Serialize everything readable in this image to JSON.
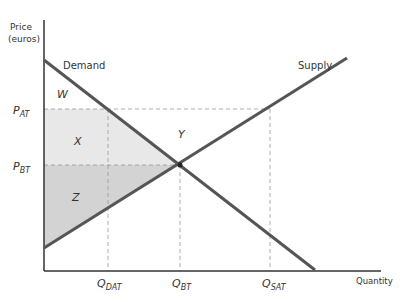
{
  "axes": {
    "y_label_line1": "Price",
    "y_label_line2": "(euros)",
    "x_label": "Quantity"
  },
  "curves": {
    "demand": "Demand",
    "supply": "Supply"
  },
  "price_ticks": {
    "p_at": {
      "main": "P",
      "sub": "AT"
    },
    "p_bt": {
      "main": "P",
      "sub": "BT"
    }
  },
  "quantity_ticks": {
    "q_dat": {
      "main": "Q",
      "sub": "DAT"
    },
    "q_bt": {
      "main": "Q",
      "sub": "BT"
    },
    "q_sat": {
      "main": "Q",
      "sub": "SAT"
    }
  },
  "regions": {
    "w": "W",
    "x": "X",
    "y": "Y",
    "z": "Z"
  },
  "colors": {
    "curve": "#555555",
    "axis": "#333333",
    "region_x": "#e8e8e8",
    "region_z": "#d3d3d3",
    "dashed": "#999999"
  }
}
